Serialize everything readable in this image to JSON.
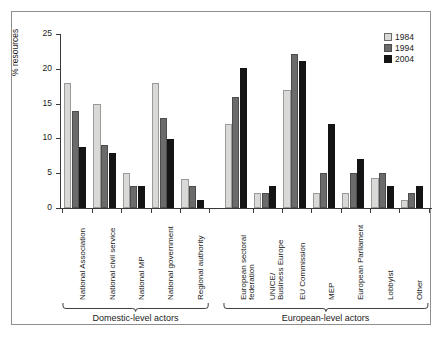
{
  "chart_data": {
    "type": "bar",
    "title": "",
    "xlabel": "",
    "ylabel": "% resources",
    "ylim": [
      0,
      25
    ],
    "yticks": [
      0,
      5,
      10,
      15,
      20,
      25
    ],
    "grid": false,
    "legend_position": "top-right",
    "categories": [
      "National Association",
      "National civil service",
      "National MP",
      "National government",
      "Regional authority",
      "European sectoral federation",
      "UNICE/ Business Europe",
      "EU Commission",
      "MEP",
      "European Parliament",
      "Lobbyist",
      "Other"
    ],
    "category_lines": [
      [
        "National Association"
      ],
      [
        "National civil service"
      ],
      [
        "National MP"
      ],
      [
        "National government"
      ],
      [
        "Regional authority"
      ],
      [
        "European sectoral",
        "federation"
      ],
      [
        "UNICE/",
        "Business Europe"
      ],
      [
        "EU Commission"
      ],
      [
        "MEP"
      ],
      [
        "European Parliament"
      ],
      [
        "Lobbyist"
      ],
      [
        "Other"
      ]
    ],
    "series": [
      {
        "name": "1984",
        "color": "#d9d9d7",
        "values": [
          18.0,
          15.0,
          5.1,
          18.0,
          4.2,
          12.0,
          2.1,
          16.9,
          2.1,
          2.1,
          4.3,
          1.2
        ]
      },
      {
        "name": "1994",
        "color": "#6b6b6b",
        "values": [
          14.0,
          9.0,
          3.1,
          13.0,
          3.1,
          16.0,
          2.1,
          22.2,
          5.1,
          5.1,
          5.1,
          2.2
        ]
      },
      {
        "name": "2004",
        "color": "#141414",
        "values": [
          8.8,
          7.9,
          3.1,
          9.9,
          1.1,
          20.1,
          3.1,
          21.1,
          12.0,
          7.0,
          3.1,
          3.2
        ]
      }
    ],
    "groups": [
      {
        "label": "Domestic-level actors",
        "from": 0,
        "to": 4
      },
      {
        "label": "European-level actors",
        "from": 5,
        "to": 11
      }
    ]
  },
  "legend": {
    "items": [
      {
        "label": "1984",
        "key": "y1984"
      },
      {
        "label": "1994",
        "key": "y1994"
      },
      {
        "label": "2004",
        "key": "y2004"
      }
    ]
  }
}
